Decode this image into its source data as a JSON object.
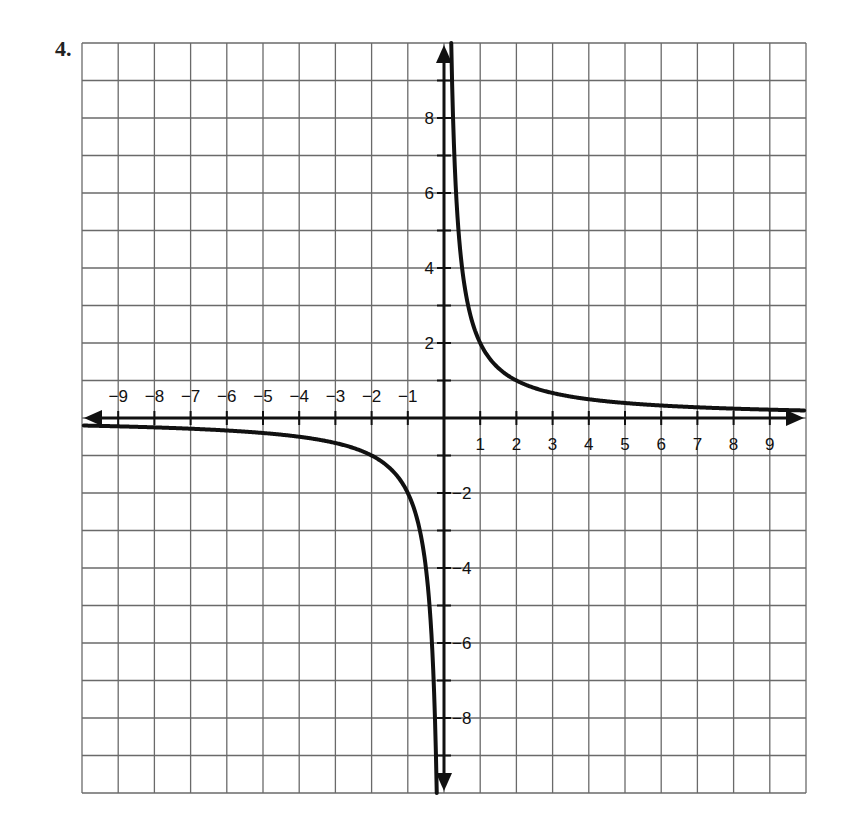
{
  "problem": {
    "number": "4."
  },
  "chart_data": {
    "type": "line",
    "title": "",
    "xlabel": "",
    "ylabel": "",
    "function": "y = 2/x",
    "xlim": [
      -10,
      10
    ],
    "ylim": [
      -10,
      10
    ],
    "grid": true,
    "legend": null,
    "x_tick_labels": [
      "-9",
      "-8",
      "-7",
      "-6",
      "-5",
      "-4",
      "-3",
      "-2",
      "-1",
      "1",
      "2",
      "3",
      "4",
      "5",
      "6",
      "7",
      "8",
      "9"
    ],
    "y_tick_labels": [
      "8",
      "6",
      "4",
      "2",
      "-2",
      "-4",
      "-6",
      "-8"
    ],
    "series": [
      {
        "name": "left branch",
        "x": [
          -10,
          -9,
          -8,
          -7,
          -6,
          -5,
          -4,
          -3,
          -2,
          -1.5,
          -1,
          -0.75,
          -0.5,
          -0.4,
          -0.3,
          -0.25,
          -0.2
        ],
        "y": [
          -0.2,
          -0.22,
          -0.25,
          -0.29,
          -0.33,
          -0.4,
          -0.5,
          -0.67,
          -1,
          -1.33,
          -2,
          -2.67,
          -4,
          -5,
          -6.67,
          -8,
          -10
        ]
      },
      {
        "name": "right branch",
        "x": [
          0.2,
          0.25,
          0.3,
          0.4,
          0.5,
          0.75,
          1,
          1.5,
          2,
          3,
          4,
          5,
          6,
          7,
          8,
          9,
          10
        ],
        "y": [
          10,
          8,
          6.67,
          5,
          4,
          2.67,
          2,
          1.33,
          1,
          0.67,
          0.5,
          0.4,
          0.33,
          0.29,
          0.25,
          0.22,
          0.2
        ]
      }
    ],
    "axes": {
      "x_arrows": "both",
      "y_arrows": "both"
    }
  },
  "style": {
    "grid_color": "#6a6a6a",
    "axis_color": "#111111",
    "curve_color": "#111111"
  }
}
